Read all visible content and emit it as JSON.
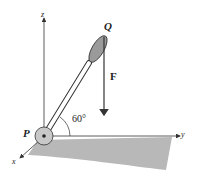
{
  "diagram": {
    "labels": {
      "z_axis": "z",
      "y_axis": "y",
      "x_axis": "x",
      "point_p": "P",
      "point_q": "Q",
      "force": "F",
      "angle": "60°"
    },
    "colors": {
      "ground": "#b8b8b8",
      "handle": "#9a9a9a",
      "line": "#333333"
    }
  }
}
